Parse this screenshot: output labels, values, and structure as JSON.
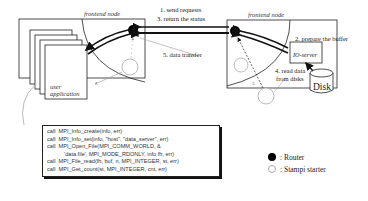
{
  "left_node": {
    "label": "frontend node",
    "app_label_line1": "user",
    "app_label_line2": "application"
  },
  "right_node": {
    "label": "frontend node",
    "io_server_label": "IO-server",
    "disk_label": "Disk"
  },
  "steps": {
    "step1": "1. send requests",
    "step2": "2. prepare the buffer",
    "step3": "3. return the status",
    "step4_line1": "4. read data",
    "step4_line2": "from disks",
    "step5": "5. data transfer",
    "step_small": "3."
  },
  "code": {
    "lines": [
      "call  MPI_Info_create(info, err)",
      "call  MPI_Info_set(info, \"host\", \"data_server\", err)",
      "call  MPI_Open_File(MPI_COMM_WORLD, &",
      "           'data.file', MPI_MODE_RDONLY, info fh, err)",
      "call  MPI_File_read(fh, buf, n, MPI_INTEGER, st, err)",
      "call  MPI_Get_count(st, MPI_INTEGER, cnt, err)"
    ]
  },
  "legend": {
    "router": ": Router",
    "stampi": ": Stampi starter"
  },
  "colors": {
    "router": "#000000",
    "stampi_outline": "#aaaaaa",
    "line": "#222222",
    "thin_line": "#999999"
  }
}
